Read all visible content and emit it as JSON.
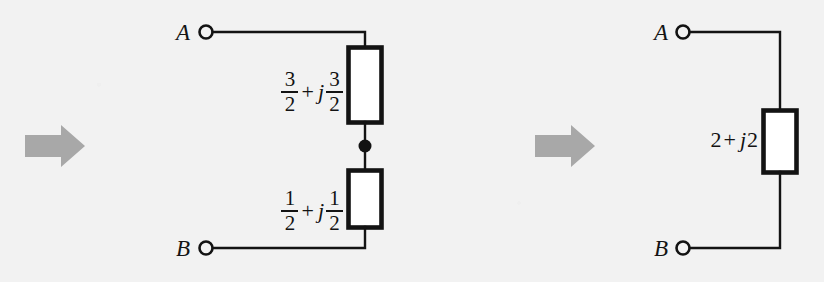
{
  "figure": {
    "background_color": "#f2f2f2",
    "ink_color": "#131313",
    "arrow_color": "#a8a8a8"
  },
  "arrows": [
    {
      "name": "transform-arrow-1",
      "glyph": "right-arrow",
      "color": "#a8a8a8"
    },
    {
      "name": "transform-arrow-2",
      "glyph": "right-arrow",
      "color": "#a8a8a8"
    }
  ],
  "left_circuit": {
    "terminal_top": "A",
    "terminal_bottom": "B",
    "components": [
      {
        "name": "impedance-top",
        "real": {
          "numerator": "3",
          "denominator": "2"
        },
        "operator": "+",
        "imaginary_unit": "j",
        "imag": {
          "numerator": "3",
          "denominator": "2"
        },
        "text": "3/2 + j3/2"
      },
      {
        "name": "impedance-bottom",
        "real": {
          "numerator": "1",
          "denominator": "2"
        },
        "operator": "+",
        "imaginary_unit": "j",
        "imag": {
          "numerator": "1",
          "denominator": "2"
        },
        "text": "1/2 + j1/2"
      }
    ],
    "junction_node": true
  },
  "right_circuit": {
    "terminal_top": "A",
    "terminal_bottom": "B",
    "components": [
      {
        "name": "impedance-equivalent",
        "real": "2",
        "operator": "+",
        "imaginary_unit": "j",
        "imag": "2",
        "text": "2 + j2"
      }
    ],
    "junction_node": false
  }
}
